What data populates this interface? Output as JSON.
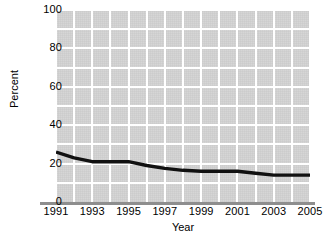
{
  "chart_data": {
    "type": "line",
    "title": "",
    "subtitle": "",
    "xlabel": "Year",
    "ylabel": "Percent",
    "x": [
      1991,
      1992,
      1993,
      1994,
      1995,
      1996,
      1997,
      1998,
      1999,
      2000,
      2001,
      2002,
      2003,
      2004,
      2005
    ],
    "values": [
      26,
      23,
      21,
      21,
      21,
      19,
      17.5,
      16.5,
      16,
      16,
      16,
      15,
      14,
      14,
      14
    ],
    "series": [
      {
        "name": "Percent",
        "values": [
          26,
          23,
          21,
          21,
          21,
          19,
          17.5,
          16.5,
          16,
          16,
          16,
          15,
          14,
          14,
          14
        ]
      }
    ],
    "xlim": [
      1991,
      2005
    ],
    "ylim": [
      0,
      100
    ],
    "ytick_labels": [
      "0",
      "20",
      "40",
      "60",
      "80",
      "100"
    ],
    "ytick_values": [
      0,
      20,
      40,
      60,
      80,
      100
    ],
    "ygrid_values": [
      10,
      20,
      30,
      40,
      50,
      60,
      70,
      80,
      90,
      100
    ],
    "xtick_labels": [
      "1991",
      "1993",
      "1995",
      "1997",
      "1999",
      "2001",
      "2003",
      "2005"
    ],
    "xtick_values": [
      1991,
      1993,
      1995,
      1997,
      1999,
      2001,
      2003,
      2005
    ],
    "xgrid_values": [
      1991,
      1992,
      1993,
      1994,
      1995,
      1996,
      1997,
      1998,
      1999,
      2000,
      2001,
      2002,
      2003,
      2004,
      2005
    ],
    "grid": true,
    "legend": false,
    "legend_position": "none",
    "annotations": [],
    "colors": {
      "plot_background": "#d4d4d4",
      "gridline": "#ffffff",
      "series_line": "#111111",
      "axis_line": "#8e8e8e",
      "text": "#000000",
      "page_background": "#ffffff"
    }
  }
}
